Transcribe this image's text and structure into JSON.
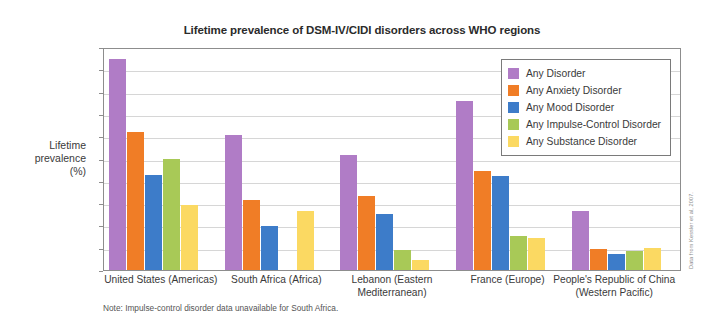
{
  "chart_data": {
    "type": "bar",
    "title": "Lifetime prevalence of DSM-IV/CIDI disorders across WHO regions",
    "xlabel": "",
    "ylabel": "Lifetime prevalence (%)",
    "ylim": [
      0,
      50
    ],
    "ytick_step": 5,
    "yticks": [
      0,
      5,
      10,
      15,
      20,
      25,
      30,
      35,
      40,
      45,
      50
    ],
    "grid": true,
    "legend_position": "top-right inside",
    "categories": [
      "United States (Americas)",
      "South Africa (Africa)",
      "Lebanon (Eastern\nMediterranean)",
      "France (Europe)",
      "People's Republic of China\n(Western Pacific)"
    ],
    "category_lines": [
      [
        "United States (Americas)"
      ],
      [
        "South Africa (Africa)"
      ],
      [
        "Lebanon (Eastern",
        "Mediterranean)"
      ],
      [
        "France (Europe)"
      ],
      [
        "People's Republic of China",
        "(Western Pacific)"
      ]
    ],
    "series": [
      {
        "name": "Any Disorder",
        "color": "#b07cc6",
        "values": [
          47.4,
          30.3,
          25.8,
          37.9,
          13.2
        ]
      },
      {
        "name": "Any Anxiety Disorder",
        "color": "#f07d26",
        "values": [
          31.0,
          15.8,
          16.7,
          22.3,
          4.8
        ]
      },
      {
        "name": "Any Mood Disorder",
        "color": "#3d7cc9",
        "values": [
          21.4,
          9.8,
          12.6,
          21.0,
          3.6
        ]
      },
      {
        "name": "Any Impulse-Control Disorder",
        "color": "#a8c957",
        "values": [
          25.0,
          null,
          4.4,
          7.6,
          4.3
        ]
      },
      {
        "name": "Any Substance Disorder",
        "color": "#fbd962",
        "values": [
          14.6,
          13.3,
          2.2,
          7.1,
          4.9
        ]
      }
    ],
    "annotations": [
      "Note: Impulse-control disorder data unavailable for South Africa."
    ]
  },
  "footnote": "Note: Impulse-control disorder data unavailable for South Africa.",
  "source_credit": "Data from Kessler et al, 2007."
}
